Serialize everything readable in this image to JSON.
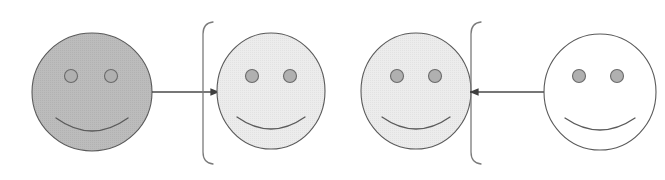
{
  "diagram": {
    "title": "Four smiley faces with arrows and brackets",
    "canvas": {
      "width": 665,
      "height": 180,
      "background": "#ffffff"
    },
    "colors": {
      "stroke": "#5a5a5a",
      "stroke_light": "#6e6e6e",
      "face_dark_fill": "#b9b9b9",
      "face_light_fill": "#e9e9e9",
      "face_white_fill": "#ffffff",
      "eye_fill": "#b0b0b0",
      "eye_stroke": "#6a6a6a",
      "arrow": "#4a4a4a",
      "bracket": "#7a7a7a"
    },
    "faces": [
      {
        "id": "face-1",
        "label": "dark gray smiley face",
        "shade": "dark",
        "fill": "#b9b9b9",
        "cx": 92,
        "cy": 92,
        "rx": 60,
        "ry": 59,
        "eye_left_x": 71,
        "eye_right_x": 111,
        "eye_y": 76,
        "eye_r": 6.5,
        "smile_y": 118,
        "smile_half_width": 36,
        "smile_depth": 13
      },
      {
        "id": "face-2",
        "label": "light gray smiley face",
        "shade": "light",
        "fill": "#e9e9e9",
        "cx": 271,
        "cy": 91,
        "rx": 54,
        "ry": 58,
        "eye_left_x": 252,
        "eye_right_x": 290,
        "eye_y": 76,
        "eye_r": 6.5,
        "smile_y": 117,
        "smile_half_width": 34,
        "smile_depth": 12
      },
      {
        "id": "face-3",
        "label": "light gray smiley face",
        "shade": "light",
        "fill": "#e9e9e9",
        "cx": 416,
        "cy": 91,
        "rx": 55,
        "ry": 58,
        "eye_left_x": 397,
        "eye_right_x": 435,
        "eye_y": 76,
        "eye_r": 6.5,
        "smile_y": 117,
        "smile_half_width": 34,
        "smile_depth": 12
      },
      {
        "id": "face-4",
        "label": "white smiley face",
        "shade": "white",
        "fill": "#ffffff",
        "cx": 600,
        "cy": 92,
        "rx": 56,
        "ry": 58,
        "eye_left_x": 579,
        "eye_right_x": 617,
        "eye_y": 76,
        "eye_r": 6.5,
        "smile_y": 118,
        "smile_half_width": 35,
        "smile_depth": 12
      }
    ],
    "brackets": [
      {
        "id": "bracket-left",
        "label": "left square bracket",
        "orientation": "left",
        "x": 203,
        "y_top": 22,
        "y_bottom": 164,
        "hook": 10
      },
      {
        "id": "bracket-right",
        "label": "left square bracket",
        "orientation": "left",
        "x": 471,
        "y_top": 22,
        "y_bottom": 164,
        "hook": 10
      }
    ],
    "arrows": [
      {
        "id": "arrow-1",
        "label": "arrow pointing right from face 1 to face 2",
        "direction": "right",
        "x_start": 152,
        "x_end": 219,
        "y": 92
      },
      {
        "id": "arrow-2",
        "label": "arrow pointing left from face 4 to face 3",
        "direction": "left",
        "x_start": 545,
        "x_end": 470,
        "y": 92
      }
    ]
  }
}
